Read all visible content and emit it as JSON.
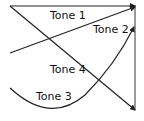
{
  "diagram": {
    "labels": {
      "tone1": "Tone 1",
      "tone2": "Tone 2",
      "tone3": "Tone 3",
      "tone4": "Tone 4"
    },
    "colors": {
      "stroke": "#222222",
      "background": "#ffffff"
    }
  }
}
